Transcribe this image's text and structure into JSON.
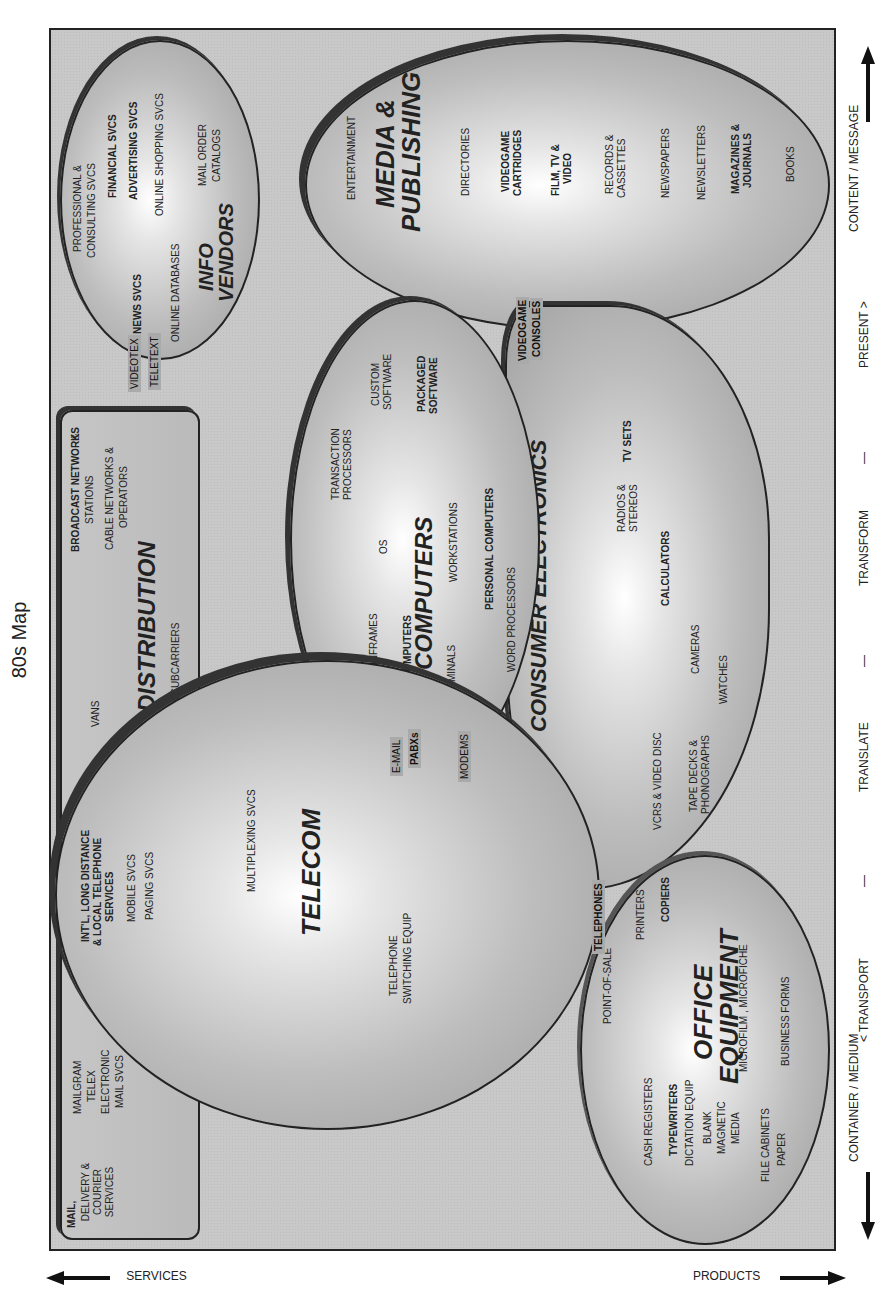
{
  "title": "80s Map",
  "axes": {
    "left_arrow": "CONTAINER / MEDIUM",
    "right_arrow": "CONTENT / MESSAGE",
    "sequence": [
      "< TRANSPORT",
      "—",
      "TRANSLATE",
      "—",
      "TRANSFORM",
      "—",
      "PRESENT >"
    ],
    "services": "SERVICES",
    "products": "PRODUCTS"
  },
  "distribution": {
    "title": "DISTRIBUTION",
    "items": [
      "BROADCAST NETWORKS",
      "&",
      "STATIONS",
      "CABLE NETWORKS &",
      "OPERATORS",
      "VANs",
      "FM SUBCARRIERS"
    ]
  },
  "mail": {
    "title": "MAIL,",
    "subtitle": "DELIVERY & COURIER SERVICES",
    "items": [
      "MAILGRAM",
      "TELEX",
      "ELECTRONIC",
      "MAIL Svcs"
    ]
  },
  "info_vendors": {
    "title": "INFO VENDORS",
    "items": [
      "PROFESSIONAL &",
      "CONSULTING SVCS",
      "FINANCIAL SVCS",
      "ADVERTISING SVCS",
      "ONLINE SHOPPING SVCS",
      "MAIL ORDER",
      "CATALOGS",
      "NEWS SVCS",
      "ONLINE DATABASES"
    ]
  },
  "media_publishing": {
    "title_line1": "MEDIA &",
    "title_line2": "PUBLISHING",
    "items": [
      "ENTERTAINMENT",
      "DIRECTORIES",
      "VIDEOGAME",
      "CARTRIDGES",
      "FILM, TV &",
      "VIDEO",
      "RECORDS &",
      "CASSETTES",
      "NEWSPAPERS",
      "NEWSLETTERS",
      "MAGAZINES &",
      "JOURNALS",
      "BOOKS"
    ]
  },
  "telecom": {
    "title": "TELECOM",
    "items": [
      "INT'L, LONG DISTANCE",
      "& LOCAL TELEPHONE",
      "SERVICES",
      "MOBILE SVCS",
      "PAGING SVCS",
      "MULTIPLEXING SVCS",
      "TELEPHONE",
      "SWITCHING EQUIP"
    ]
  },
  "computers": {
    "title": "COMPUTERS",
    "items": [
      "TRANSACTION",
      "PROCESSORS",
      "CUSTOM",
      "SOFTWARE",
      "PACKAGED",
      "SOFTWARE",
      "OS",
      "MAINFRAMES",
      "MINICOMPUTERS",
      "WORKSTATIONS",
      "TERMINALS",
      "PERSONAL COMPUTERS",
      "WORD PROCESSORS"
    ]
  },
  "consumer_electronics": {
    "title": "CONSUMER ELECTRONICS",
    "items": [
      "TV SETS",
      "RADIOS &",
      "STEREOS",
      "CALCULATORS",
      "CAMERAS",
      "WATCHES",
      "VCRs  & VIDEO DISC",
      "TAPE DECKS &",
      "PHONOGRAPHS"
    ]
  },
  "office_equipment": {
    "title_line1": "OFFICE",
    "title_line2": "EQUIPMENT",
    "items": [
      "POINT-OF-SALE",
      "PRINTERS",
      "COPIERS",
      "CASH REGISTERS",
      "TYPEWRITERS",
      "DICTATION EQUIP",
      "BLANK",
      "MAGNETIC",
      "MEDIA",
      "MICROFILM , MICROFICHE",
      "BUSINESS FORMS",
      "FILE CABINETS",
      "PAPER"
    ]
  },
  "connectors": {
    "videotex": "VIDEOTEX",
    "teletext": "TELETEXT",
    "email": "E-MAIL",
    "pabxs": "PABXs",
    "modems": "MODEMS",
    "telephones": "TELEPHONES",
    "videogame_consoles_1": "VIDEOGAME",
    "videogame_consoles_2": "CONSOLES"
  }
}
